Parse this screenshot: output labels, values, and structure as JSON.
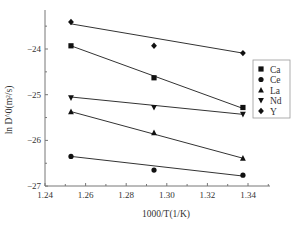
{
  "chart_data": {
    "type": "scatter",
    "title": "",
    "xlabel": "1000/T(1/K)",
    "ylabel": "ln D^0(m²/s)",
    "xlim": [
      1.24,
      1.35
    ],
    "ylim": [
      -27,
      -23.2
    ],
    "x_ticks": [
      1.24,
      1.26,
      1.28,
      1.3,
      1.32,
      1.34
    ],
    "x_tick_labels": [
      "1.24",
      "1.26",
      "1.28",
      "1.30",
      "1.32",
      "1.34"
    ],
    "y_ticks": [
      -24,
      -25,
      -26,
      -27
    ],
    "y_tick_labels": [
      "−24",
      "−25",
      "−26",
      "−27"
    ],
    "grid": false,
    "legend_position": "right",
    "x": [
      1.2528,
      1.2937,
      1.3375
    ],
    "series": [
      {
        "name": "Ca",
        "marker": "square",
        "values": [
          -23.93,
          -24.63,
          -25.28
        ],
        "fit": [
          -23.93,
          -25.3
        ]
      },
      {
        "name": "Ce",
        "marker": "circle",
        "values": [
          -26.35,
          -26.65,
          -26.76
        ],
        "fit": [
          -26.35,
          -26.78
        ]
      },
      {
        "name": "La",
        "marker": "triangle-up",
        "values": [
          -25.37,
          -25.83,
          -26.39
        ],
        "fit": [
          -25.37,
          -26.39
        ]
      },
      {
        "name": "Nd",
        "marker": "triangle-down",
        "values": [
          -25.07,
          -25.28,
          -25.43
        ],
        "fit": [
          -25.05,
          -25.43
        ]
      },
      {
        "name": "Y",
        "marker": "diamond",
        "values": [
          -23.41,
          -23.93,
          -24.09
        ],
        "fit": [
          -23.45,
          -24.09
        ]
      }
    ]
  }
}
